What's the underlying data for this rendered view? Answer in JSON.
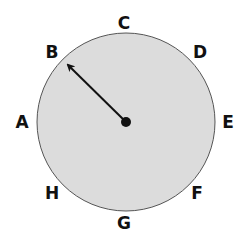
{
  "diagram": {
    "circle": {
      "cx": 126,
      "cy": 122,
      "r": 89,
      "fill": "#dcdcdc",
      "stroke": "#555555"
    },
    "pointer": {
      "from": [
        126,
        122
      ],
      "to": [
        67,
        64
      ],
      "points_to": "B"
    },
    "labels": [
      {
        "id": "A",
        "text": "A",
        "x": 22,
        "y": 128
      },
      {
        "id": "B",
        "text": "B",
        "x": 52,
        "y": 58
      },
      {
        "id": "C",
        "text": "C",
        "x": 124,
        "y": 29
      },
      {
        "id": "D",
        "text": "D",
        "x": 200,
        "y": 58
      },
      {
        "id": "E",
        "text": "E",
        "x": 228,
        "y": 128
      },
      {
        "id": "F",
        "text": "F",
        "x": 197,
        "y": 199
      },
      {
        "id": "G",
        "text": "G",
        "x": 124,
        "y": 229
      },
      {
        "id": "H",
        "text": "H",
        "x": 52,
        "y": 199
      }
    ]
  }
}
